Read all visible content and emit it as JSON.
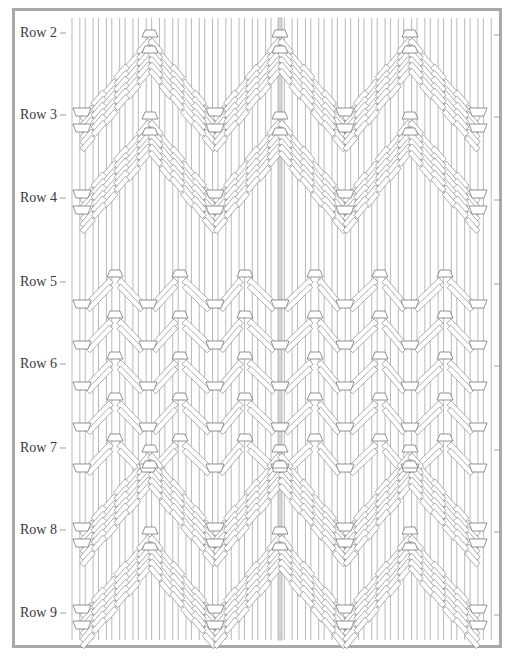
{
  "row_labels": [
    "Row 2",
    "Row 3",
    "Row 4",
    "Row 5",
    "Row 6",
    "Row 7",
    "Row 8",
    "Row 9"
  ],
  "colors": {
    "frame": "#a9a9a9",
    "cord_stroke": "#8a8a8a",
    "center_cord": "#9a9a9a",
    "knot_fill": "#ffffff",
    "label_text": "#3a3a3a"
  },
  "pattern": {
    "cord_count": 64,
    "sections": [
      {
        "name": "chevron-band-1",
        "from_row": "Row 2",
        "to_row": "Row 4",
        "type": "double half hitch chevron",
        "apex_count": 3
      },
      {
        "name": "dense-band",
        "from_row": "Row 5",
        "to_row": "Row 6",
        "type": "alternating small chevrons",
        "apex_count": 6
      },
      {
        "name": "chevron-band-2",
        "from_row": "Row 7",
        "to_row": "Row 9",
        "type": "double half hitch chevron",
        "apex_count": 3
      }
    ]
  }
}
